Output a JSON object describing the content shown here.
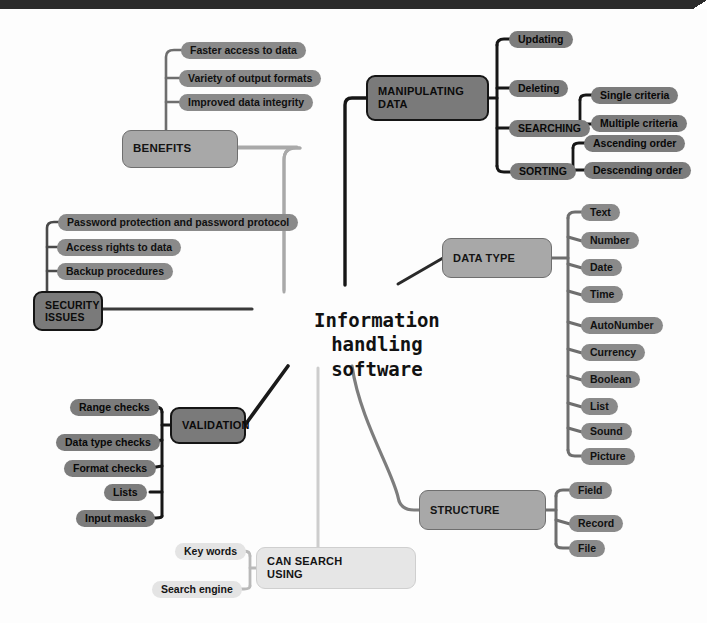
{
  "diagram": {
    "type": "mind-map",
    "center": "Information\nhandling\nsoftware",
    "palette": {
      "page_background": "#fdfdfd",
      "top_bar": "#2b2b2b",
      "branch_dark": "#7a7a7a",
      "branch_mid": "#a8a8a8",
      "branch_light": "#e6e6e6",
      "leaf_pill": "#8a8a8a",
      "leaf_pill_light": "#e4e4e4",
      "link_dark": "#161616",
      "link_mid": "#6e6e6e",
      "link_light": "#c9c9c9"
    },
    "branches": [
      {
        "id": "benefits",
        "label": "BENEFITS",
        "style": "mid",
        "children": [
          "Faster access to data",
          "Variety of output formats",
          "Improved data integrity"
        ]
      },
      {
        "id": "security-issues",
        "label": "SECURITY\nISSUES",
        "style": "dark",
        "children": [
          "Password protection and password protocol",
          "Access rights to data",
          "Backup procedures"
        ]
      },
      {
        "id": "manipulating-data",
        "label": "MANIPULATING\nDATA",
        "style": "dark",
        "children": [
          {
            "label": "Updating",
            "children": []
          },
          {
            "label": "Deleting",
            "children": []
          },
          {
            "label": "SEARCHING",
            "children": [
              "Single criteria",
              "Multiple criteria"
            ]
          },
          {
            "label": "SORTING",
            "children": [
              "Ascending order",
              "Descending order"
            ]
          }
        ]
      },
      {
        "id": "data-type",
        "label": "DATA TYPE",
        "style": "mid",
        "children": [
          "Text",
          "Number",
          "Date",
          "Time",
          "AutoNumber",
          "Currency",
          "Boolean",
          "List",
          "Sound",
          "Picture"
        ]
      },
      {
        "id": "validation",
        "label": "VALIDATION",
        "style": "dark",
        "children": [
          "Range checks",
          "Data type checks",
          "Format checks",
          "Lists",
          "Input masks"
        ]
      },
      {
        "id": "structure",
        "label": "STRUCTURE",
        "style": "mid",
        "children": [
          "Field",
          "Record",
          "File"
        ]
      },
      {
        "id": "can-search-using",
        "label": "CAN SEARCH\nUSING",
        "style": "light",
        "children": [
          "Key words",
          "Search engine"
        ]
      }
    ]
  },
  "nodes": {
    "center_l1": "Information",
    "center_l2": "handling",
    "center_l3": "software",
    "benefits": "BENEFITS",
    "benefits_c0": "Faster access to data",
    "benefits_c1": "Variety of output formats",
    "benefits_c2": "Improved data integrity",
    "security": "SECURITY",
    "security2": "ISSUES",
    "security_c0": "Password protection and password protocol",
    "security_c1": "Access rights to data",
    "security_c2": "Backup procedures",
    "manip": "MANIPULATING",
    "manip2": "DATA",
    "manip_c0": "Updating",
    "manip_c1": "Deleting",
    "manip_c2": "SEARCHING",
    "manip_c3": "SORTING",
    "search_c0": "Single criteria",
    "search_c1": "Multiple criteria",
    "sort_c0": "Ascending order",
    "sort_c1": "Descending order",
    "datatype": "DATA TYPE",
    "dt0": "Text",
    "dt1": "Number",
    "dt2": "Date",
    "dt3": "Time",
    "dt4": "AutoNumber",
    "dt5": "Currency",
    "dt6": "Boolean",
    "dt7": "List",
    "dt8": "Sound",
    "dt9": "Picture",
    "validation": "VALIDATION",
    "val_c0": "Range checks",
    "val_c1": "Data type checks",
    "val_c2": "Format checks",
    "val_c3": "Lists",
    "val_c4": "Input masks",
    "structure": "STRUCTURE",
    "st0": "Field",
    "st1": "Record",
    "st2": "File",
    "cansearch": "CAN SEARCH",
    "cansearch2": "USING",
    "cs0": "Key words",
    "cs1": "Search engine"
  }
}
